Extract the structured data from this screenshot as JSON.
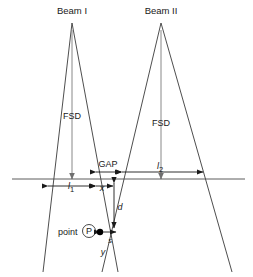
{
  "figure": {
    "type": "technical-diagram",
    "width": 253,
    "height": 277,
    "background_color": "#ffffff",
    "line_color": "#3a3a3a",
    "axis_color": "#7a7a7a",
    "dimension_color": "#1a1a1a"
  },
  "beams": [
    {
      "id": "beam-1",
      "title": "Beam I",
      "title_x": 72,
      "title_y": 14,
      "apex_x": 72,
      "apex_y": 23,
      "left_edge_bottom_x": 43,
      "right_edge_bottom_x": 118,
      "bottom_y": 272,
      "fsd_label": "FSD",
      "fsd_label_x": 72,
      "fsd_label_y": 119,
      "fsd_axis_x": 72,
      "fsd_axis_top_y": 30,
      "fsd_axis_bottom_y": 179
    },
    {
      "id": "beam-2",
      "title": "Beam II",
      "title_x": 161,
      "title_y": 14,
      "apex_x": 161,
      "apex_y": 23,
      "left_edge_bottom_x": 102,
      "right_edge_bottom_x": 232,
      "bottom_y": 272,
      "fsd_label": "FSD",
      "fsd_label_x": 161,
      "fsd_label_y": 126,
      "fsd_axis_x": 161,
      "fsd_axis_top_y": 30,
      "fsd_axis_bottom_y": 179
    }
  ],
  "baseline": {
    "label": "surface-line",
    "x1": 12,
    "x2": 245,
    "y": 179
  },
  "dimensions": [
    {
      "id": "l1",
      "label": "l",
      "subscript": "1",
      "label_x": 71,
      "label_y": 189,
      "x1": 48,
      "x2": 95,
      "y": 186,
      "arrows": "both"
    },
    {
      "id": "gap",
      "label": "GAP",
      "subscript": "",
      "label_x": 108,
      "label_y": 167,
      "x1": 96,
      "x2": 121,
      "y": 172,
      "arrows": "both"
    },
    {
      "id": "l2",
      "label": "l",
      "subscript": "2",
      "label_x": 160,
      "label_y": 169,
      "x1": 122,
      "x2": 203,
      "y": 172,
      "arrows": "both"
    },
    {
      "id": "x",
      "label": "x",
      "subscript": "",
      "label_x": 102,
      "label_y": 191,
      "x1": 96,
      "x2": 113,
      "y": 186,
      "arrows": "both"
    },
    {
      "id": "d",
      "label": "d",
      "subscript": "",
      "label_x": 120,
      "label_y": 210,
      "x1": 114,
      "x2": 114,
      "y1": 183,
      "y2": 228,
      "orientation": "vertical",
      "arrows": "both"
    },
    {
      "id": "s",
      "label": "s",
      "subscript": "",
      "label_x": 110,
      "label_y": 243,
      "x1": 100,
      "x2": 116,
      "y": 232,
      "arrows": "both"
    }
  ],
  "point": {
    "id": "point-p",
    "text": "point",
    "symbol": "P",
    "text_x": 58,
    "text_y": 235,
    "circle_x": 89,
    "circle_y": 231,
    "circle_r": 6.5,
    "dot_x": 100,
    "dot_y": 232,
    "dot_r": 3.2
  },
  "annotations": [
    {
      "id": "y-label",
      "label": "y",
      "x": 103,
      "y": 255
    }
  ]
}
